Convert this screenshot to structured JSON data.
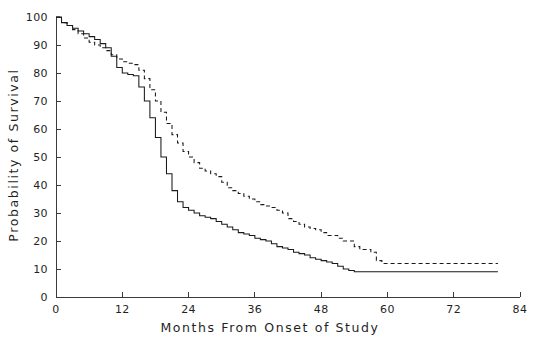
{
  "chart_data": {
    "type": "line",
    "title": "",
    "subtitle": "",
    "xlabel": "Months From Onset of Study",
    "ylabel": "Probability of Survival",
    "xlim": [
      0,
      84
    ],
    "ylim": [
      0,
      100
    ],
    "xticks": [
      0,
      12,
      24,
      36,
      48,
      60,
      72,
      84
    ],
    "xtick_labels": [
      "0",
      "12",
      "24",
      "36",
      "48",
      "60",
      "72",
      "84"
    ],
    "yticks": [
      0,
      10,
      20,
      30,
      40,
      50,
      60,
      70,
      80,
      90,
      100
    ],
    "ytick_labels": [
      "0",
      "10",
      "20",
      "30",
      "40",
      "50",
      "60",
      "70",
      "80",
      "90",
      "100"
    ],
    "grid": false,
    "legend": "none",
    "step_style": "kaplan-meier",
    "annotations": [],
    "series": [
      {
        "name": "solid-curve",
        "style": "solid",
        "color": "#1a1a1a",
        "points": [
          [
            0,
            100
          ],
          [
            1,
            98
          ],
          [
            2,
            97
          ],
          [
            3,
            96
          ],
          [
            4,
            95
          ],
          [
            5,
            94
          ],
          [
            6,
            93
          ],
          [
            7,
            92
          ],
          [
            8,
            90.5
          ],
          [
            9,
            89
          ],
          [
            10,
            86
          ],
          [
            11,
            82
          ],
          [
            12,
            80
          ],
          [
            13,
            79.5
          ],
          [
            14,
            79
          ],
          [
            15,
            75
          ],
          [
            16,
            70
          ],
          [
            17,
            64
          ],
          [
            18,
            57
          ],
          [
            19,
            50
          ],
          [
            20,
            44
          ],
          [
            21,
            38
          ],
          [
            22,
            34
          ],
          [
            23,
            32
          ],
          [
            24,
            31
          ],
          [
            25,
            30
          ],
          [
            26,
            29
          ],
          [
            27,
            28.5
          ],
          [
            28,
            28
          ],
          [
            29,
            27
          ],
          [
            30,
            26
          ],
          [
            31,
            25
          ],
          [
            32,
            24
          ],
          [
            33,
            23
          ],
          [
            34,
            22.5
          ],
          [
            35,
            22
          ],
          [
            36,
            21
          ],
          [
            37,
            20.5
          ],
          [
            38,
            20
          ],
          [
            39,
            19
          ],
          [
            40,
            18
          ],
          [
            41,
            17.5
          ],
          [
            42,
            17
          ],
          [
            43,
            16
          ],
          [
            44,
            15.5
          ],
          [
            45,
            15
          ],
          [
            46,
            14
          ],
          [
            47,
            13.5
          ],
          [
            48,
            13
          ],
          [
            49,
            12.5
          ],
          [
            50,
            12
          ],
          [
            51,
            11
          ],
          [
            52,
            10
          ],
          [
            53,
            9.5
          ],
          [
            54,
            9
          ],
          [
            60,
            9
          ],
          [
            70,
            9
          ],
          [
            80,
            9
          ]
        ]
      },
      {
        "name": "dashed-curve",
        "style": "dashed",
        "color": "#1a1a1a",
        "points": [
          [
            0,
            100
          ],
          [
            1,
            98
          ],
          [
            2,
            97
          ],
          [
            3,
            95.5
          ],
          [
            4,
            94
          ],
          [
            5,
            92.5
          ],
          [
            6,
            91
          ],
          [
            7,
            90
          ],
          [
            8,
            89
          ],
          [
            9,
            88
          ],
          [
            10,
            86.5
          ],
          [
            11,
            85
          ],
          [
            12,
            84
          ],
          [
            13,
            83.5
          ],
          [
            14,
            83
          ],
          [
            15,
            81
          ],
          [
            16,
            78
          ],
          [
            17,
            74
          ],
          [
            18,
            70
          ],
          [
            19,
            66
          ],
          [
            20,
            62
          ],
          [
            21,
            58
          ],
          [
            22,
            55
          ],
          [
            23,
            52
          ],
          [
            24,
            50
          ],
          [
            25,
            48
          ],
          [
            26,
            46
          ],
          [
            27,
            45
          ],
          [
            28,
            44
          ],
          [
            29,
            43
          ],
          [
            30,
            41
          ],
          [
            31,
            39
          ],
          [
            32,
            38
          ],
          [
            33,
            37
          ],
          [
            34,
            36
          ],
          [
            35,
            35
          ],
          [
            36,
            34
          ],
          [
            37,
            33
          ],
          [
            38,
            32.5
          ],
          [
            39,
            32
          ],
          [
            40,
            31
          ],
          [
            41,
            30
          ],
          [
            42,
            28
          ],
          [
            43,
            27
          ],
          [
            44,
            26
          ],
          [
            45,
            25
          ],
          [
            46,
            24.5
          ],
          [
            47,
            24
          ],
          [
            48,
            23
          ],
          [
            49,
            22
          ],
          [
            50,
            22
          ],
          [
            51,
            21
          ],
          [
            52,
            20
          ],
          [
            53,
            20
          ],
          [
            54,
            18
          ],
          [
            55,
            17
          ],
          [
            56,
            17
          ],
          [
            57,
            16
          ],
          [
            58,
            13
          ],
          [
            59,
            12
          ],
          [
            60,
            12
          ],
          [
            70,
            12
          ],
          [
            80,
            12
          ]
        ]
      }
    ]
  }
}
